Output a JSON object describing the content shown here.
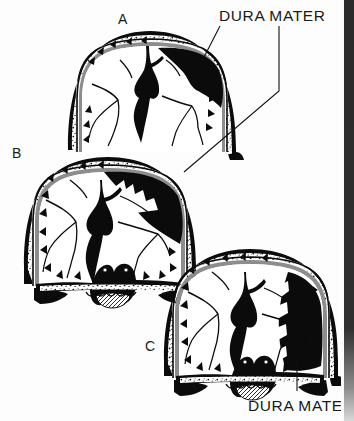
{
  "figure": {
    "background_color": "#ffffff",
    "ink_color": "#0b0b0b",
    "dura_grey": "#8d8d8d",
    "blood_color": "#0b0b0b"
  },
  "labels": {
    "top_callout": "DURA MATER",
    "bottom_callout": "DURA MATER"
  },
  "panels": [
    {
      "id": "a",
      "letter": "A",
      "caption": "",
      "hematoma_size": "small",
      "hematoma_side": "right",
      "has_skull_base": false
    },
    {
      "id": "b",
      "letter": "B",
      "caption": "",
      "hematoma_size": "medium",
      "hematoma_side": "right",
      "has_skull_base": true
    },
    {
      "id": "c",
      "letter": "C",
      "caption": "",
      "hematoma_size": "large",
      "hematoma_side": "right",
      "has_skull_base": true
    }
  ],
  "callouts": [
    {
      "id": "top",
      "text": "DURA MATER",
      "text_x": 219,
      "text_y": 20,
      "points_to": [
        "panel-a-hematoma",
        "panel-b-hematoma"
      ]
    },
    {
      "id": "bottom",
      "text": "DURA MATER",
      "text_x": 248,
      "text_y": 410,
      "points_to": [
        "panel-c-hematoma"
      ]
    }
  ],
  "page_edge": {
    "present": true,
    "color": "#2a2a2a",
    "x": 344,
    "width": 10
  },
  "anatomy_legend": {
    "skull_outer_table": "outer cortical bone line",
    "diploe": "stippled cancellous bone",
    "skull_inner_table": "inner cortical bone line",
    "dura_mater": "grey membrane lining inner skull",
    "brain": "white cerebral hemispheres with dark sulci",
    "longitudinal_fissure": "central dark branching fissure",
    "sella_turcica": "midline skull base depression",
    "sphenoid_sinus": "cross-hatched air cell at skull base",
    "hematoma": "solid black crescent collection"
  }
}
